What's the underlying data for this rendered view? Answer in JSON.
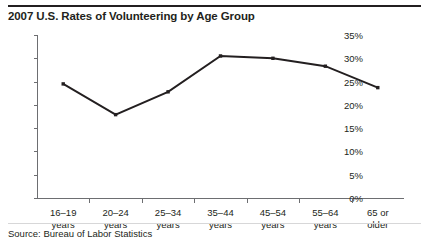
{
  "chart_data": {
    "type": "line",
    "title": "2007 U.S. Rates of Volunteering by Age Group",
    "xlabel": "",
    "ylabel": "",
    "categories": [
      "16–19\nyears",
      "20–24\nyears",
      "25–34\nyears",
      "35–44\nyears",
      "45–54\nyears",
      "55–64\nyears",
      "65 or\nolder"
    ],
    "category_lines": [
      [
        "16–19",
        "years"
      ],
      [
        "20–24",
        "years"
      ],
      [
        "25–34",
        "years"
      ],
      [
        "35–44",
        "years"
      ],
      [
        "45–54",
        "years"
      ],
      [
        "55–64",
        "years"
      ],
      [
        "65 or",
        "older"
      ]
    ],
    "values": [
      24.5,
      17.9,
      22.8,
      30.5,
      30.0,
      28.3,
      23.7
    ],
    "ylim": [
      0,
      35
    ],
    "ytick_values": [
      35,
      30,
      25,
      20,
      15,
      10,
      5,
      0
    ],
    "ytick_labels": [
      "35%",
      "30%",
      "25%",
      "20%",
      "15%",
      "10%",
      "5%",
      "0%"
    ],
    "grid": false,
    "legend": "none",
    "line_color": "#231f20",
    "marker": "square"
  },
  "source": {
    "note": "Source: Bureau of Labor Statistics"
  }
}
